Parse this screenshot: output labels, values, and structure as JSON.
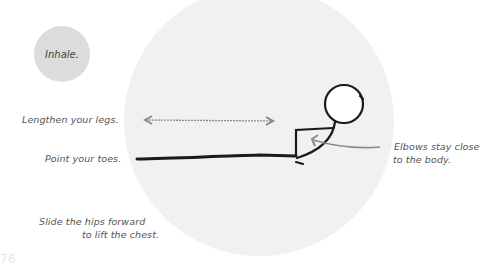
{
  "breath": {
    "label": "Inhale."
  },
  "cues": {
    "legs": "Lengthen your legs.",
    "toes": "Point your toes.",
    "hips_line1": "Slide the hips forward",
    "hips_line2": "to lift the chest.",
    "elbows_line1": "Elbows stay close",
    "elbows_line2": "to the body."
  },
  "page_number": "76",
  "colors": {
    "background": "#ffffff",
    "pose_circle": "#f1f1f1",
    "breath_circle": "#dcdcdc",
    "figure_stroke": "#1a1a1a",
    "arrow_stroke": "#8a8a8a",
    "text": "#555555"
  },
  "icons": {
    "stretch_arrow": "double-headed-arrow",
    "elbow_arrow": "curved-arrow"
  }
}
